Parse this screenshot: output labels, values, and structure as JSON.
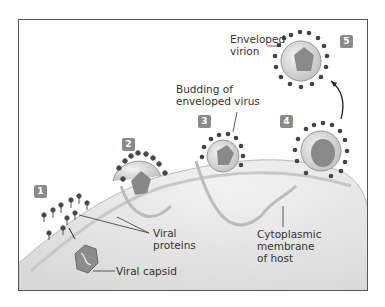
{
  "figure": {
    "steps": [
      {
        "number": "1"
      },
      {
        "number": "2"
      },
      {
        "number": "3"
      },
      {
        "number": "4"
      },
      {
        "number": "5"
      }
    ],
    "labels": {
      "enveloped_virion": [
        "Enveloped",
        "virion"
      ],
      "budding": [
        "Budding of",
        "enveloped virus"
      ],
      "viral_proteins": [
        "Viral",
        "proteins"
      ],
      "viral_capsid": "Viral capsid",
      "membrane": [
        "Cytoplasmic",
        "membrane",
        "of host"
      ]
    },
    "colors": {
      "frame": "#555555",
      "badge": "#8a8a8a",
      "cell": "#e4e4e4",
      "spike": "#444444",
      "text": "#333333"
    }
  }
}
